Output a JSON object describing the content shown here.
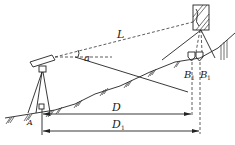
{
  "diagram": {
    "title": "",
    "labels": {
      "slope_distance": "L",
      "vertical_angle": "a",
      "horizontal_distance": "D",
      "horizontal_distance_corrected": "D",
      "horizontal_distance_corrected_sub": "1",
      "station_point": "A",
      "target_point_1": "B",
      "target_point_1_sub": "1",
      "target_point_2": "B",
      "target_point_2_sub": "1"
    },
    "elements": [
      "theodolite-on-tripod",
      "reflector-target-on-tripod",
      "prism-pair",
      "sloped-ground",
      "line-of-sight",
      "horizontal-reference-line",
      "dimension-arrows"
    ],
    "colors": {
      "line": "#222222",
      "background": "#ffffff"
    }
  }
}
